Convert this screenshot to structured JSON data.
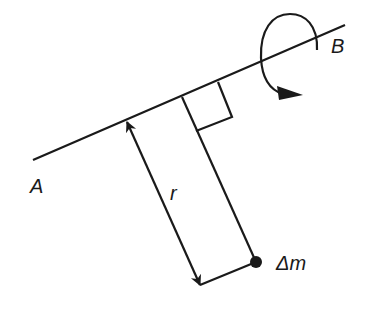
{
  "diagram": {
    "type": "rotation-axis-moment-of-inertia",
    "labels": {
      "axis_end_a": "A",
      "axis_end_b": "B",
      "distance": "r",
      "mass_element": "Δm"
    },
    "colors": {
      "stroke": "#1a1a1a",
      "background": "#ffffff"
    },
    "elements": {
      "axis": {
        "x1": 33,
        "y1": 160,
        "x2": 345,
        "y2": 25
      },
      "rotation_arrow": "curved arrow encircling axis near B",
      "right_angle_marker": "square at foot of perpendicular",
      "radius_arrow": "double-headed arrow of length r parallel to perpendicular",
      "mass_point": {
        "cx": 256,
        "cy": 262,
        "r": 5
      }
    }
  }
}
